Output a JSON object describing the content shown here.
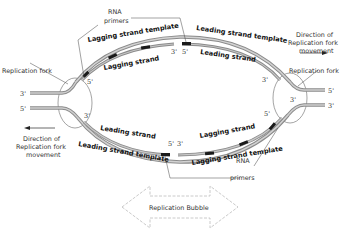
{
  "diagram": {
    "title": "Replication Bubble",
    "colors": {
      "strand_outer": "#8a8a8a",
      "strand_inner": "#c8c8c8",
      "primer": "#1a1a1a",
      "bubble_arrow": "#bdbdbd",
      "text": "#222222"
    },
    "labels": {
      "rna_primers_top": "RNA",
      "rna_primers_top_2": "primers",
      "rna_primers_bottom": "RNA",
      "rna_primers_bottom_2": "primers",
      "lagging_template_top": "Lagging strand template",
      "lagging_strand_top": "Lagging strand",
      "leading_template_top": "Leading strand template",
      "leading_strand_top": "Leading strand",
      "leading_strand_bottom": "Leading strand",
      "leading_template_bottom": "Leading strand template",
      "lagging_strand_bottom": "Lagging strand",
      "lagging_template_bottom": "Lagging strand template",
      "fork_left": "Replication fork",
      "fork_right": "Replication fork",
      "direction_right_1": "Direction of",
      "direction_right_2": "Replication fork",
      "direction_right_3": "movement",
      "direction_left_1": "Direction of",
      "direction_left_2": "Replication fork",
      "direction_left_3": "movement",
      "bubble": "Replication Bubble"
    },
    "ends": {
      "left_top": "3'",
      "left_bottom": "5'",
      "right_top": "5'",
      "right_bottom": "3'",
      "top_left_5": "5'",
      "top_mid_3": "3'",
      "top_mid_5": "5'",
      "top_right_3": "3'",
      "bottom_left_3": "3'",
      "bottom_mid_5": "5'",
      "bottom_mid_3": "3'",
      "bottom_right_5": "5'",
      "right_fork_3": "3'"
    }
  }
}
